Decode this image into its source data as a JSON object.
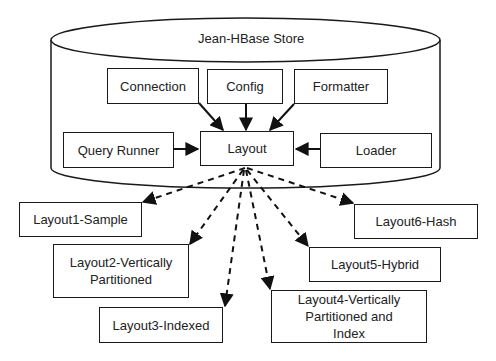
{
  "store": {
    "label": "Jean-HBase Store"
  },
  "components": {
    "connection": "Connection",
    "config": "Config",
    "formatter": "Formatter",
    "query_runner": "Query Runner",
    "layout": "Layout",
    "loader": "Loader"
  },
  "layouts": [
    {
      "id": "layout1",
      "label": "Layout1-Sample"
    },
    {
      "id": "layout2",
      "label": "Layout2-Vertically Partitioned"
    },
    {
      "id": "layout3",
      "label": "Layout3-Indexed"
    },
    {
      "id": "layout4",
      "label": "Layout4-Vertically Partitioned and Index"
    },
    {
      "id": "layout5",
      "label": "Layout5-Hybrid"
    },
    {
      "id": "layout6",
      "label": "Layout6-Hash"
    }
  ],
  "edges": [
    {
      "from": "Connection",
      "to": "Layout",
      "style": "solid"
    },
    {
      "from": "Config",
      "to": "Layout",
      "style": "solid"
    },
    {
      "from": "Formatter",
      "to": "Layout",
      "style": "solid"
    },
    {
      "from": "Query Runner",
      "to": "Layout",
      "style": "solid"
    },
    {
      "from": "Loader",
      "to": "Layout",
      "style": "solid"
    },
    {
      "from": "Layout",
      "to": "Layout1-Sample",
      "style": "dashed"
    },
    {
      "from": "Layout",
      "to": "Layout2-Vertically Partitioned",
      "style": "dashed"
    },
    {
      "from": "Layout",
      "to": "Layout3-Indexed",
      "style": "dashed"
    },
    {
      "from": "Layout",
      "to": "Layout4-Vertically Partitioned and Index",
      "style": "dashed"
    },
    {
      "from": "Layout",
      "to": "Layout5-Hybrid",
      "style": "dashed"
    },
    {
      "from": "Layout",
      "to": "Layout6-Hash",
      "style": "dashed"
    }
  ]
}
